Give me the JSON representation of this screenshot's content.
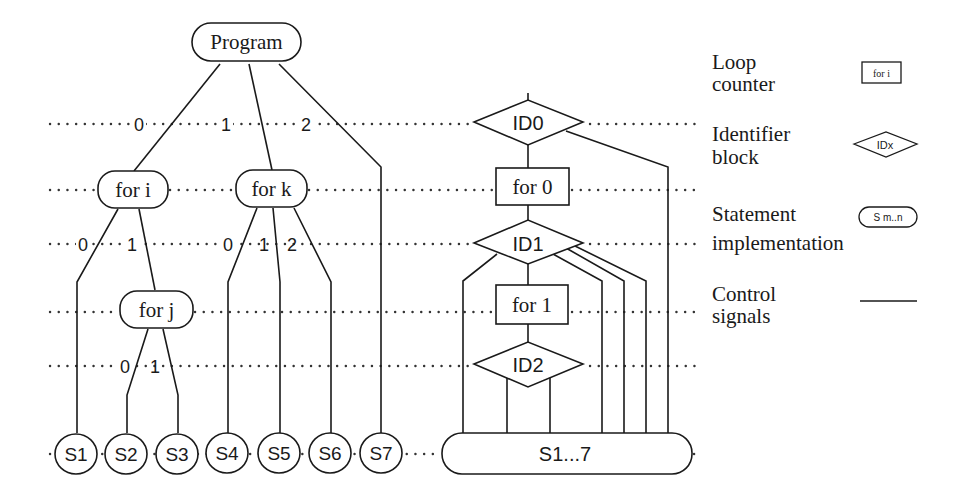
{
  "diagram": {
    "type": "program-tree-to-control-structure",
    "colors": {
      "line": "#1a1a1a",
      "background": "#ffffff"
    },
    "tree": {
      "root": {
        "label": "Program"
      },
      "root_branch_labels": [
        "0",
        "1",
        "2"
      ],
      "loops": [
        {
          "id": "for_i",
          "label": "for i",
          "branch_labels": [
            "0",
            "1"
          ]
        },
        {
          "id": "for_k",
          "label": "for k",
          "branch_labels": [
            "0",
            "1",
            "2"
          ]
        },
        {
          "id": "for_j",
          "label": "for j",
          "branch_labels": [
            "0",
            "1"
          ]
        }
      ],
      "statements": [
        "S1",
        "S2",
        "S3",
        "S4",
        "S5",
        "S6",
        "S7"
      ]
    },
    "control": {
      "identifiers": [
        "ID0",
        "ID1",
        "ID2"
      ],
      "counters": [
        "for 0",
        "for 1"
      ],
      "implementation": "S1...7"
    },
    "legend": {
      "items": [
        {
          "line1": "Loop",
          "line2": "counter",
          "symbol": "rect",
          "symbol_text": "for i"
        },
        {
          "line1": "Identifier",
          "line2": "block",
          "symbol": "diamond",
          "symbol_text": "IDx"
        },
        {
          "line1": "Statement",
          "line2": "implementation",
          "symbol": "rounded",
          "symbol_text": "S m..n"
        },
        {
          "line1": "Control",
          "line2": "signals",
          "symbol": "line",
          "symbol_text": ""
        }
      ]
    }
  }
}
